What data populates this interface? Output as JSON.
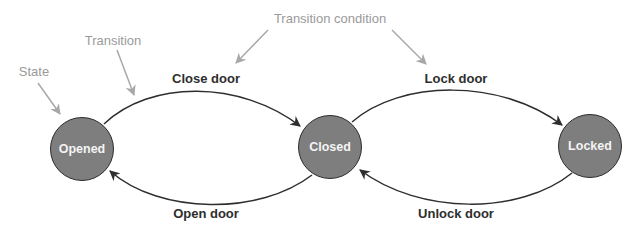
{
  "colors": {
    "state_fill": "#7e7e7e",
    "state_stroke": "#2b2b2b",
    "state_text": "#f4f4f4",
    "edge": "#2e2e2e",
    "annotation": "#9a9a9a",
    "label": "#2e2e2e"
  },
  "annotations": {
    "state": "State",
    "transition": "Transition",
    "transition_condition": "Transition condition"
  },
  "states": [
    {
      "id": "opened",
      "label": "Opened"
    },
    {
      "id": "closed",
      "label": "Closed"
    },
    {
      "id": "locked",
      "label": "Locked"
    }
  ],
  "transitions": [
    {
      "from": "opened",
      "to": "closed",
      "label": "Close door"
    },
    {
      "from": "closed",
      "to": "opened",
      "label": "Open door"
    },
    {
      "from": "closed",
      "to": "locked",
      "label": "Lock door"
    },
    {
      "from": "locked",
      "to": "closed",
      "label": "Unlock door"
    }
  ]
}
